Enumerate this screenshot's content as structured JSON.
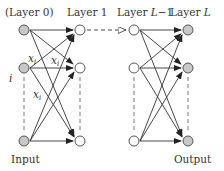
{
  "layers": [
    {
      "label": "(Layer 0)",
      "x": 24,
      "role": "input",
      "fill": "#c8c8c8"
    },
    {
      "label": "Layer 1",
      "x": 80,
      "role": "hidden",
      "fill": "#ffffff"
    },
    {
      "label_prefix": "Layer ",
      "label_var": "L",
      "label_suffix": "−1",
      "x": 134,
      "role": "hidden",
      "fill": "#ffffff"
    },
    {
      "label_prefix": "Layer ",
      "label_var": "L",
      "label_suffix": "",
      "x": 188,
      "role": "output",
      "fill": "#c8c8c8"
    }
  ],
  "node_rows_y": [
    30,
    68,
    141
  ],
  "annotations": {
    "xi_1": "x",
    "xi_sub": "i",
    "index_i": "i",
    "input_label": "Input",
    "output_label": "Output"
  },
  "colors": {
    "stroke": "#333333",
    "node_gray": "#c8c8c8",
    "dash": "#555555"
  }
}
